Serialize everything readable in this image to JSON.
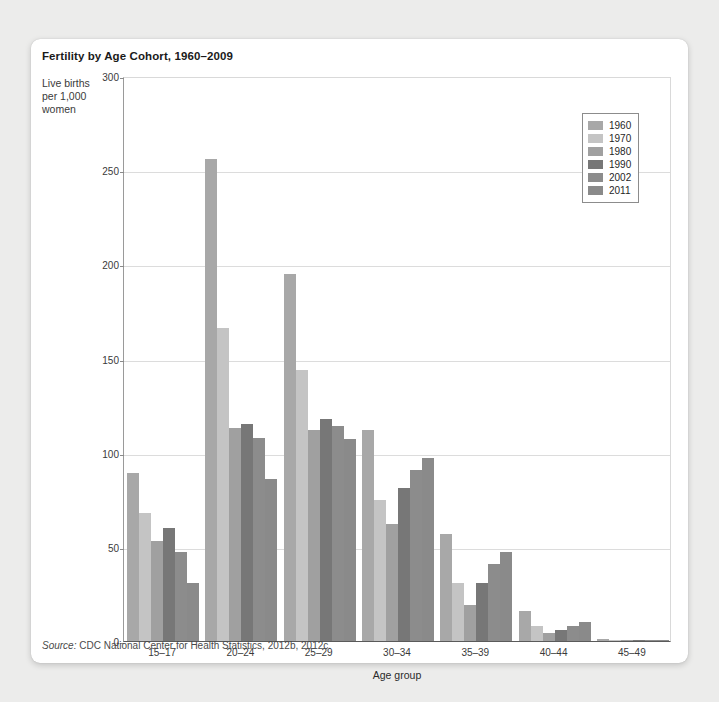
{
  "card": {
    "title": "Fertility by Age Cohort, 1960–2009",
    "y_axis_title": "Live births per 1,000 women",
    "x_axis_title": "Age group",
    "source_prefix": "Source:",
    "source_text": " CDC National Center for Health Statistics, 2012b, 2012c."
  },
  "legend": {
    "position": "top-right",
    "entries": [
      {
        "label": "1960",
        "color": "#a8a8a8"
      },
      {
        "label": "1970",
        "color": "#c4c4c4"
      },
      {
        "label": "1980",
        "color": "#a0a0a0"
      },
      {
        "label": "1990",
        "color": "#777777"
      },
      {
        "label": "2002",
        "color": "#8c8c8c"
      },
      {
        "label": "2011",
        "color": "#8a8a8a"
      }
    ]
  },
  "chart_data": {
    "type": "bar",
    "title": "Fertility by Age Cohort, 1960–2009",
    "xlabel": "Age group",
    "ylabel": "Live births per 1,000 women",
    "ylim": [
      0,
      300
    ],
    "yticks": [
      0,
      50,
      100,
      150,
      200,
      250,
      300
    ],
    "grid": true,
    "legend_position": "top-right",
    "categories": [
      "15–17",
      "20–24",
      "25–29",
      "30–34",
      "35–39",
      "40–44",
      "45–49"
    ],
    "series": [
      {
        "name": "1960",
        "color": "#a8a8a8",
        "values": [
          89,
          256,
          195,
          112,
          57,
          16,
          1
        ]
      },
      {
        "name": "1970",
        "color": "#c4c4c4",
        "values": [
          68,
          166,
          144,
          75,
          31,
          8,
          0.5
        ]
      },
      {
        "name": "1980",
        "color": "#a0a0a0",
        "values": [
          53,
          113,
          112,
          62,
          19,
          4,
          0.3
        ]
      },
      {
        "name": "1990",
        "color": "#777777",
        "values": [
          60,
          115,
          118,
          81,
          31,
          6,
          0.3
        ]
      },
      {
        "name": "2002",
        "color": "#8c8c8c",
        "values": [
          47,
          108,
          114,
          91,
          41,
          8,
          0.5
        ]
      },
      {
        "name": "2011",
        "color": "#8a8a8a",
        "values": [
          31,
          86,
          107,
          97,
          47,
          10,
          0.7
        ]
      }
    ],
    "annotations": [
      "Source: CDC National Center for Health Statistics, 2012b, 2012c."
    ]
  }
}
